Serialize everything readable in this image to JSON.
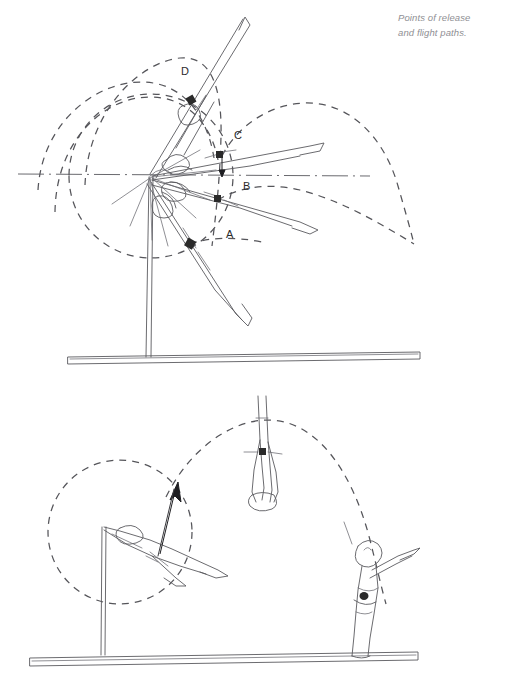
{
  "page": {
    "background_color": "#ffffff",
    "width": 507,
    "height": 690
  },
  "caption": {
    "line1": "Points of release",
    "line2": "and flight paths.",
    "color": "#8f8f94"
  },
  "colors": {
    "ink": "#5a5a5f",
    "ink_dark": "#3c3c40",
    "dash": "#55555a",
    "marker": "#2a2a2a",
    "arrow": "#1f1f22",
    "caption": "#8f8f94"
  },
  "top_figure": {
    "name": "release-points-diagram",
    "description": "Gymnast swinging on a high bar shown in four successive release positions with dashed flight paths.",
    "release_points": [
      {
        "id": "A",
        "label": "A",
        "label_x": 226,
        "label_y": 234,
        "marker_x": 190,
        "marker_y": 243
      },
      {
        "id": "B",
        "label": "B",
        "label_x": 243,
        "label_y": 186,
        "marker_x": 218,
        "marker_y": 199
      },
      {
        "id": "C",
        "label": "C",
        "label_x": 234,
        "label_y": 135,
        "marker_x": 220,
        "marker_y": 155
      },
      {
        "id": "D",
        "label": "D",
        "label_x": 182,
        "label_y": 71,
        "marker_x": 191,
        "marker_y": 100
      }
    ],
    "bar_pivot": {
      "x": 151,
      "y": 176
    },
    "axis_line": {
      "label": "horizontal-centre-line",
      "x1": 18,
      "y1": 174,
      "x2": 370,
      "y2": 176
    },
    "apparatus": {
      "post_label": "bar-post",
      "floor_label": "floor-beam"
    }
  },
  "bottom_figure": {
    "name": "release-and-flight-diagram",
    "description": "Gymnast releasing the bar in a horizontal position, velocity arrow at release, inverted flight position at apex and landing position.",
    "swing_circle_label": "swing-radius-circle",
    "flight_path_label": "flight-path-arc",
    "velocity_arrow_label": "release-velocity-arrow",
    "positions": [
      {
        "id": "release",
        "name": "release-position-figure"
      },
      {
        "id": "apex",
        "name": "flight-apex-figure"
      },
      {
        "id": "landing",
        "name": "landing-figure"
      }
    ]
  }
}
